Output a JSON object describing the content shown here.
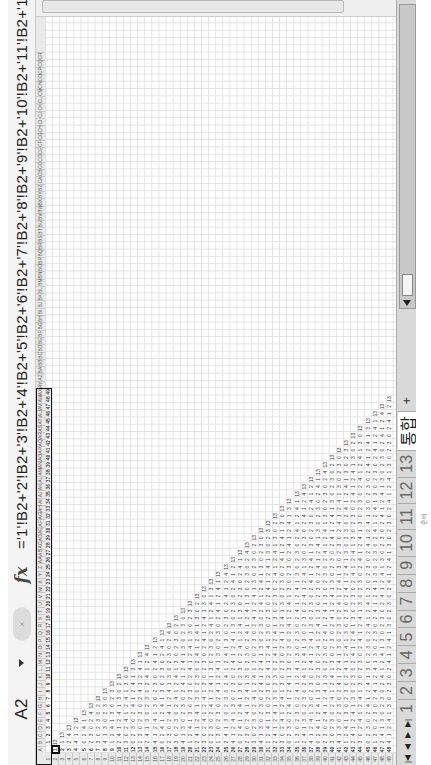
{
  "formula_bar": {
    "name_box": "A2",
    "fx_label": "fx",
    "cancel_label": "×",
    "formula": "='1'!B2+'2'!B2+'3'!B2+'4'!B2+'5'!B2+'6'!B2+'7'!B2+'8'!B2+'9'!B2+'10'!B2+'11'!B2+'12'!B2+'13'!B2"
  },
  "grid": {
    "selected_cell": "A2",
    "column_headers": [
      "A",
      "B",
      "C",
      "D",
      "E",
      "F",
      "G",
      "H",
      "I",
      "J",
      "K",
      "L",
      "M",
      "N",
      "O",
      "P",
      "Q",
      "R",
      "S",
      "T",
      "U",
      "V",
      "W",
      "X",
      "Y",
      "Z",
      "AA",
      "AB",
      "AC",
      "AD",
      "AE",
      "AF",
      "AG",
      "AH",
      "AI",
      "AJ",
      "AK",
      "AL",
      "AM",
      "AN",
      "AO",
      "AP",
      "AQ",
      "AR",
      "AS",
      "AT",
      "AU",
      "AV",
      "AW",
      "AX",
      "AY",
      "AZ",
      "BA",
      "BB",
      "BC",
      "BD",
      "BE",
      "BF",
      "BG",
      "BH",
      "BI",
      "BJ",
      "BK",
      "BL",
      "BM",
      "BN",
      "BO",
      "BP",
      "BQ",
      "BR",
      "BS",
      "BT",
      "BU",
      "BV",
      "BW",
      "BX",
      "BY",
      "BZ",
      "CA",
      "CB",
      "CC",
      "CD",
      "CE",
      "CF",
      "CG",
      "CH",
      "CI",
      "CJ",
      "CK",
      "CL",
      "CM",
      "CN",
      "CO",
      "CP",
      "CQ",
      "CR"
    ],
    "row_count": 49,
    "header_row_values_count": 49,
    "diagonal_value": 13,
    "note": "Triangular matrix: row 1 contains 1..49; each row r has values in columns B..r-1 and the value 13 on the diagonal"
  },
  "sheet_tabs": {
    "nav": [
      "|◀",
      "◀",
      "▶",
      "▶|"
    ],
    "tabs": [
      "1",
      "2",
      "3",
      "4",
      "5",
      "6",
      "7",
      "8",
      "9",
      "10",
      "11",
      "12",
      "13",
      "통합"
    ],
    "active_index": 13,
    "new_sheet_label": "+"
  },
  "status_bar": {
    "text": "준비"
  }
}
